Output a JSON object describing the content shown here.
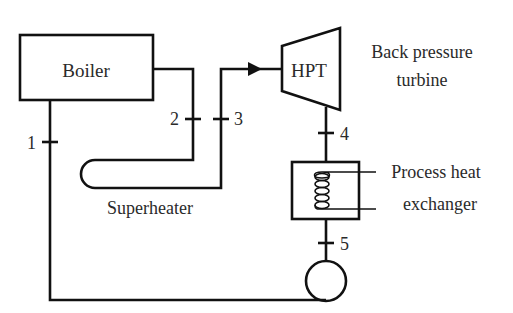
{
  "diagram": {
    "title": "",
    "components": {
      "boiler": {
        "label": "Boiler"
      },
      "turbine": {
        "label": "HPT",
        "description": "Back pressure turbine",
        "description_lines": [
          "Back pressure",
          "turbine"
        ]
      },
      "superheater": {
        "label": "Superheater"
      },
      "heat_exchanger": {
        "label": "Process heat exchanger",
        "label_lines": [
          "Process heat",
          "exchanger"
        ]
      },
      "pump": {
        "label": ""
      }
    },
    "states": [
      {
        "id": "1",
        "label": "1"
      },
      {
        "id": "2",
        "label": "2"
      },
      {
        "id": "3",
        "label": "3"
      },
      {
        "id": "4",
        "label": "4"
      },
      {
        "id": "5",
        "label": "5"
      }
    ],
    "colors": {
      "line": "#111111",
      "text": "#2a2a2a",
      "background": "#ffffff"
    }
  }
}
